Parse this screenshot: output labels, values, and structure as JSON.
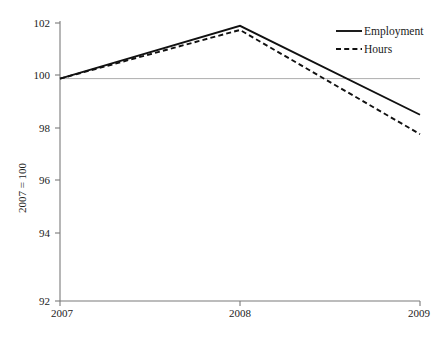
{
  "chart_data": {
    "type": "line",
    "title": "",
    "subtitle": "",
    "xlabel": "",
    "ylabel": "2007 = 100",
    "x": [
      "2007",
      "2008",
      "2009"
    ],
    "xlim": [
      "2007",
      "2009"
    ],
    "ylim": [
      92,
      102
    ],
    "yticks": [
      92,
      94,
      96,
      98,
      100,
      102
    ],
    "ytick_labels": [
      "92",
      "94",
      "96",
      "98",
      "100",
      "102"
    ],
    "xtick_labels": [
      "2007",
      "2008",
      "2009"
    ],
    "grid": false,
    "reference_line": 100,
    "legend_position": "top-right",
    "series": [
      {
        "name": "Employment",
        "style": "solid",
        "color": "#111111",
        "values": [
          100.0,
          101.9,
          98.7
        ]
      },
      {
        "name": "Hours",
        "style": "dashed",
        "color": "#111111",
        "values": [
          100.0,
          101.75,
          98.0
        ]
      }
    ]
  },
  "legend": {
    "entries": [
      {
        "label": "Employment",
        "style": "solid"
      },
      {
        "label": "Hours",
        "style": "dashed"
      }
    ]
  },
  "axes": {
    "y_title": "2007 = 100",
    "y_ticks": [
      "102",
      "100",
      "98",
      "96",
      "94",
      "92"
    ],
    "x_ticks": [
      "2007",
      "2008",
      "2009"
    ]
  }
}
